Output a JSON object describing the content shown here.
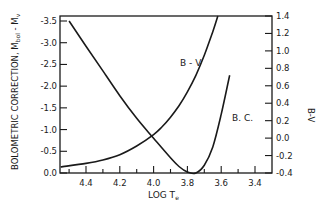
{
  "chart_data": {
    "type": "line",
    "title": "",
    "xlabel": "LOG T_e",
    "ylabel": "BOLOMETRIC CORRECTION, M_bol - M_v",
    "y2label": "B-V",
    "xlim": [
      4.55,
      3.3
    ],
    "ylim": [
      0.0,
      -3.5
    ],
    "y2lim": [
      -0.4,
      1.4
    ],
    "x_ticks": [
      "4.4",
      "4.2",
      "4.0",
      "3.8",
      "3.6",
      "3.4"
    ],
    "y_ticks": [
      "-3.5",
      "-3.0",
      "-2.5",
      "-2.0",
      "-1.5",
      "-1.0",
      "-0.5",
      "0.0"
    ],
    "y2_ticks": [
      "1.4",
      "1.2",
      "1.0",
      "0.8",
      "0.6",
      "0.4",
      "0.2",
      "0.0",
      "-0.2",
      "-0.4"
    ],
    "grid": false,
    "series": [
      {
        "name": "B.C.",
        "axis": "left",
        "x": [
          4.5,
          4.4,
          4.3,
          4.2,
          4.1,
          4.0,
          3.9,
          3.85,
          3.8,
          3.75,
          3.7,
          3.65,
          3.6,
          3.55
        ],
        "values": [
          -3.5,
          -2.92,
          -2.35,
          -1.78,
          -1.26,
          -0.8,
          -0.35,
          -0.15,
          -0.02,
          0.0,
          -0.18,
          -0.6,
          -1.35,
          -2.25
        ]
      },
      {
        "name": "B-V",
        "axis": "right",
        "x": [
          4.55,
          4.4,
          4.3,
          4.2,
          4.1,
          4.0,
          3.95,
          3.9,
          3.85,
          3.8,
          3.75,
          3.7,
          3.65,
          3.62
        ],
        "values": [
          -0.33,
          -0.29,
          -0.25,
          -0.19,
          -0.09,
          0.04,
          0.13,
          0.24,
          0.37,
          0.53,
          0.72,
          0.95,
          1.22,
          1.4
        ]
      }
    ],
    "annotations": [
      {
        "text": "B-V",
        "x": 3.92,
        "y2": 0.92
      },
      {
        "text": "B.C.",
        "x": 3.62,
        "y2": 0.22
      }
    ]
  },
  "labels": {
    "y_axis": "BOLOMETRIC CORRECTION, M",
    "y_axis_sub1": "bol",
    "y_axis_mid": " - M",
    "y_axis_sub2": "v",
    "y2_axis": "B-V",
    "x_axis": "LOG T",
    "x_axis_sub": "e",
    "bv_curve_label": "B - V",
    "bc_curve_label": "B. C."
  }
}
